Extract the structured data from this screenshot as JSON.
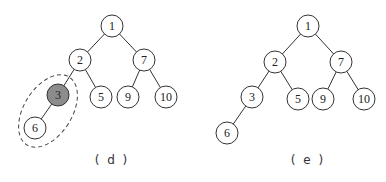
{
  "panels": [
    {
      "caption": "( d )",
      "highlighted_node": "3",
      "circled_subtree": [
        "3",
        "6"
      ],
      "nodes": [
        {
          "id": "1",
          "label": "1",
          "x": 112,
          "y": 26
        },
        {
          "id": "2",
          "label": "2",
          "x": 80,
          "y": 60
        },
        {
          "id": "7",
          "label": "7",
          "x": 144,
          "y": 60
        },
        {
          "id": "3",
          "label": "3",
          "x": 58,
          "y": 95
        },
        {
          "id": "5",
          "label": "5",
          "x": 101,
          "y": 97
        },
        {
          "id": "9",
          "label": "9",
          "x": 128,
          "y": 97
        },
        {
          "id": "10",
          "label": "10",
          "x": 166,
          "y": 97
        },
        {
          "id": "6",
          "label": "6",
          "x": 35,
          "y": 128
        }
      ],
      "edges": [
        [
          "1",
          "2"
        ],
        [
          "1",
          "7"
        ],
        [
          "2",
          "3"
        ],
        [
          "2",
          "5"
        ],
        [
          "7",
          "9"
        ],
        [
          "7",
          "10"
        ],
        [
          "3",
          "6"
        ]
      ]
    },
    {
      "caption": "( e )",
      "highlighted_node": null,
      "nodes": [
        {
          "id": "1",
          "label": "1",
          "x": 308,
          "y": 26
        },
        {
          "id": "2",
          "label": "2",
          "x": 275,
          "y": 62
        },
        {
          "id": "7",
          "label": "7",
          "x": 341,
          "y": 62
        },
        {
          "id": "3",
          "label": "3",
          "x": 252,
          "y": 97
        },
        {
          "id": "5",
          "label": "5",
          "x": 298,
          "y": 99
        },
        {
          "id": "9",
          "label": "9",
          "x": 323,
          "y": 99
        },
        {
          "id": "10",
          "label": "10",
          "x": 364,
          "y": 99
        },
        {
          "id": "6",
          "label": "6",
          "x": 227,
          "y": 133
        }
      ],
      "edges": [
        [
          "1",
          "2"
        ],
        [
          "1",
          "7"
        ],
        [
          "2",
          "3"
        ],
        [
          "2",
          "5"
        ],
        [
          "7",
          "9"
        ],
        [
          "7",
          "10"
        ],
        [
          "3",
          "6"
        ]
      ]
    }
  ],
  "colors": {
    "highlight": "#8c8c8c",
    "stroke": "#333333"
  }
}
